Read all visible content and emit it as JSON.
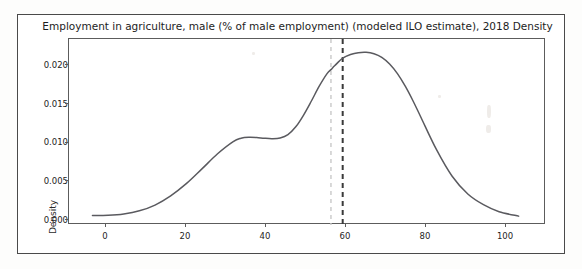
{
  "figure": {
    "title": "Employment in agriculture, male (% of male employment) (modeled ILO estimate), 2018  Density",
    "background_color": "#ffffff",
    "border_color": "#4a4a4a"
  },
  "chart_data": {
    "type": "line",
    "title": "Employment in agriculture, male (% of male employment) (modeled ILO estimate), 2018  Density",
    "subtitle": "",
    "xlabel": "",
    "ylabel": "Density",
    "xlim": [
      -10,
      112
    ],
    "ylim": [
      -0.0012,
      0.024
    ],
    "grid": false,
    "legend": null,
    "x_ticks": [
      0,
      20,
      40,
      60,
      80,
      100
    ],
    "x_tick_labels": [
      "0",
      "20",
      "40",
      "60",
      "80",
      "100"
    ],
    "y_ticks": [
      0.0,
      0.005,
      0.01,
      0.015,
      0.02
    ],
    "y_tick_labels": [
      "0.000",
      "0.005",
      "0.010",
      "0.015",
      "0.020"
    ],
    "series": [
      {
        "name": "Density",
        "kind": "kde-curve",
        "color": "#5a5a5f",
        "line_width": 1.5,
        "x": [
          -4,
          0,
          4,
          8,
          12,
          16,
          20,
          24,
          28,
          32,
          34,
          36,
          38,
          40,
          42,
          44,
          46,
          48,
          50,
          52,
          54,
          56,
          57,
          58,
          60,
          62,
          64,
          66,
          68,
          70,
          72,
          74,
          76,
          78,
          80,
          84,
          88,
          92,
          96,
          100,
          105
        ],
        "y": [
          8e-05,
          0.00012,
          0.0003,
          0.00072,
          0.0015,
          0.00275,
          0.0044,
          0.0064,
          0.00845,
          0.0101,
          0.01055,
          0.01068,
          0.01065,
          0.01055,
          0.0105,
          0.0106,
          0.01105,
          0.0121,
          0.0137,
          0.0156,
          0.0176,
          0.0193,
          0.01985,
          0.0204,
          0.0214,
          0.0219,
          0.02215,
          0.0222,
          0.022,
          0.0215,
          0.0206,
          0.0193,
          0.0176,
          0.0156,
          0.0134,
          0.009,
          0.0054,
          0.003,
          0.00155,
          0.0006,
          0.0
        ]
      }
    ],
    "annotations": [
      {
        "name": "reference-line-light",
        "type": "vline",
        "x": 57,
        "color": "#c9c9c9",
        "linestyle": "dashed",
        "line_width": 1.4
      },
      {
        "name": "reference-line-dark",
        "type": "vline",
        "x": 60,
        "color": "#3a3a3a",
        "linestyle": "dashed",
        "line_width": 2.0
      }
    ]
  }
}
